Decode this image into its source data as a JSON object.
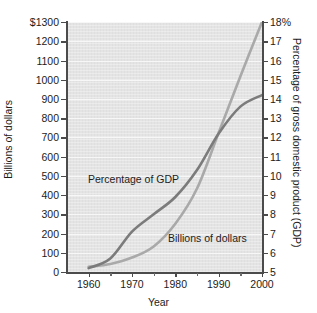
{
  "chart_data": {
    "type": "line",
    "title": "",
    "subtitle": "",
    "xlabel": "Year",
    "ylabel": "Billions of dollars",
    "y2label": "Percentage of gross domestic product (GDP)",
    "grid": true,
    "legend_position": "inline-annotations",
    "xlim": [
      1955,
      2000
    ],
    "xticks": [
      1960,
      1970,
      1980,
      1990,
      2000
    ],
    "xtick_labels": [
      "1960",
      "1970",
      "1980",
      "1990",
      "2000"
    ],
    "xminor_ticks": [
      1965,
      1975,
      1985,
      1995
    ],
    "ylim": [
      0,
      1300
    ],
    "yticks": [
      0,
      100,
      200,
      300,
      400,
      500,
      600,
      700,
      800,
      900,
      1000,
      1100,
      1200,
      1300
    ],
    "ytick_labels": [
      "0",
      "100",
      "200",
      "300",
      "400",
      "500",
      "600",
      "700",
      "800",
      "900",
      "1000",
      "1100",
      "1200",
      "$1300"
    ],
    "y2lim": [
      5,
      18
    ],
    "y2ticks": [
      5,
      6,
      7,
      8,
      9,
      10,
      11,
      12,
      13,
      14,
      15,
      16,
      17,
      18
    ],
    "y2tick_labels": [
      "5",
      "6",
      "7",
      "8",
      "9",
      "10",
      "11",
      "12",
      "13",
      "14",
      "15",
      "16",
      "17",
      "18%"
    ],
    "series": [
      {
        "name": "Billions of dollars",
        "axis": "left",
        "color": "#a9a9a9",
        "x": [
          1960,
          1965,
          1970,
          1975,
          1980,
          1985,
          1990,
          1995,
          2000
        ],
        "values": [
          27,
          42,
          75,
          133,
          251,
          434,
          724,
          1017,
          1300
        ]
      },
      {
        "name": "Percentage of GDP",
        "axis": "right",
        "color": "#7b7b7b",
        "x": [
          1960,
          1965,
          1970,
          1975,
          1980,
          1985,
          1990,
          1995,
          2000
        ],
        "values": [
          5.2,
          5.7,
          7.1,
          8.0,
          8.9,
          10.3,
          12.2,
          13.6,
          14.2
        ]
      }
    ],
    "annotations": [
      {
        "text": "Percentage of GDP",
        "x": 1973,
        "y_left": 430
      },
      {
        "text": "Billions of dollars",
        "x": 1990,
        "y_left": 185
      }
    ],
    "colors": {
      "plot_background": "#e4e4e4",
      "gridline": "#f7f7f7",
      "axis": "#4b4b4b",
      "text": "#1c1c1c",
      "series_billions": "#a9a9a9",
      "series_percentage": "#7b7b7b"
    }
  }
}
